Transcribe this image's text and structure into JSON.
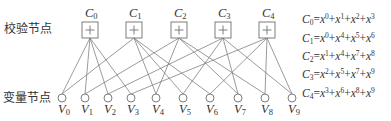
{
  "labels": {
    "check_nodes": "校验节点",
    "variable_nodes": "变量节点"
  },
  "check_nodes": [
    {
      "name": "C",
      "sub": "0",
      "symbol": "+"
    },
    {
      "name": "C",
      "sub": "1",
      "symbol": "+"
    },
    {
      "name": "C",
      "sub": "2",
      "symbol": "+"
    },
    {
      "name": "C",
      "sub": "3",
      "symbol": "+"
    },
    {
      "name": "C",
      "sub": "4",
      "symbol": "+"
    }
  ],
  "variable_nodes": [
    {
      "name": "V",
      "sub": "0"
    },
    {
      "name": "V",
      "sub": "1"
    },
    {
      "name": "V",
      "sub": "2"
    },
    {
      "name": "V",
      "sub": "3"
    },
    {
      "name": "V",
      "sub": "4"
    },
    {
      "name": "V",
      "sub": "5"
    },
    {
      "name": "V",
      "sub": "6"
    },
    {
      "name": "V",
      "sub": "7"
    },
    {
      "name": "V",
      "sub": "8"
    },
    {
      "name": "V",
      "sub": "9"
    }
  ],
  "edges": [
    [
      0,
      0
    ],
    [
      0,
      1
    ],
    [
      0,
      2
    ],
    [
      0,
      3
    ],
    [
      1,
      0
    ],
    [
      1,
      4
    ],
    [
      1,
      5
    ],
    [
      1,
      6
    ],
    [
      2,
      1
    ],
    [
      2,
      4
    ],
    [
      2,
      7
    ],
    [
      2,
      8
    ],
    [
      3,
      2
    ],
    [
      3,
      5
    ],
    [
      3,
      7
    ],
    [
      3,
      9
    ],
    [
      4,
      3
    ],
    [
      4,
      6
    ],
    [
      4,
      8
    ],
    [
      4,
      9
    ]
  ],
  "equations": [
    {
      "lhs": "C",
      "lhs_sub": "0",
      "terms": [
        "0",
        "1",
        "2",
        "3"
      ]
    },
    {
      "lhs": "C",
      "lhs_sub": "1",
      "terms": [
        "0",
        "4",
        "5",
        "6"
      ]
    },
    {
      "lhs": "C",
      "lhs_sub": "2",
      "terms": [
        "1",
        "4",
        "7",
        "8"
      ]
    },
    {
      "lhs": "C",
      "lhs_sub": "3",
      "terms": [
        "2",
        "5",
        "7",
        "9"
      ]
    },
    {
      "lhs": "C",
      "lhs_sub": "4",
      "terms": [
        "3",
        "6",
        "8",
        "9"
      ]
    }
  ],
  "equation_symbols": {
    "equals": "=",
    "plus": "+",
    "base": "x"
  }
}
